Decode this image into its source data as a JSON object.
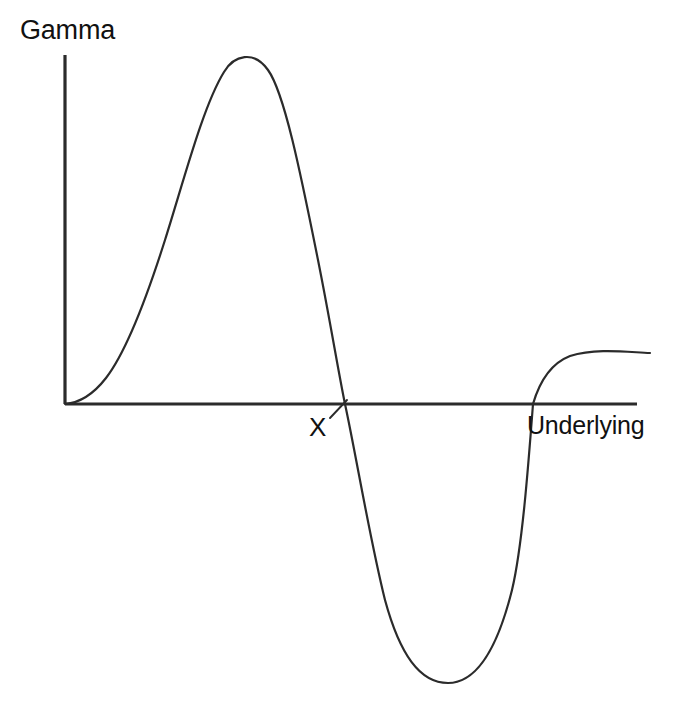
{
  "figure": {
    "width": 675,
    "height": 707,
    "background_color": "#ffffff",
    "line_color": "#2b2b2b",
    "text_color": "#111111"
  },
  "labels": {
    "y_axis": "Gamma",
    "x_axis": "Underlying",
    "strike_marker": "X"
  },
  "chart_data": {
    "type": "line",
    "title": "",
    "subtitle": "",
    "xlabel": "Underlying",
    "ylabel": "Gamma",
    "grid": false,
    "legend": null,
    "axis_style": "open-l-shaped-axes-no-ticks",
    "x_axis_pixel": {
      "x_start": 65,
      "x_end": 637,
      "y": 404
    },
    "y_axis_pixel": {
      "y_start": 55,
      "y_end": 404,
      "x": 65
    },
    "xlim": [
      0,
      1
    ],
    "ylim": [
      -1.0,
      1.0
    ],
    "xticks": [],
    "yticks": [],
    "annotations": [
      {
        "text": "X",
        "meaning": "strike price at zero-gamma crossing",
        "x_pixel": 345,
        "y_pixel": 404,
        "has_tick_mark": true,
        "tick_style": "short-diagonal"
      }
    ],
    "series": [
      {
        "name": "Gamma of a structured position",
        "color": "#2b2b2b",
        "line_width": 2.2,
        "description": "Rises from origin to a positive peak, falls steeply through zero at strike X, reaches a deep negative trough, then rises back through zero and flattens to a positive plateau.",
        "key_points": [
          {
            "label": "origin",
            "x": 0.0,
            "y": 0.0,
            "x_pixel": 65,
            "y_pixel": 404
          },
          {
            "label": "peak",
            "x": 0.31,
            "y": 1.0,
            "x_pixel": 243,
            "y_pixel": 55
          },
          {
            "label": "zero-crossing-up",
            "x": 0.49,
            "y": 0.0,
            "x_pixel": 345,
            "y_pixel": 404
          },
          {
            "label": "trough",
            "x": 0.67,
            "y": -0.8,
            "x_pixel": 448,
            "y_pixel": 683
          },
          {
            "label": "zero-crossing-down",
            "x": 0.82,
            "y": 0.0,
            "x_pixel": 533,
            "y_pixel": 404
          },
          {
            "label": "plateau-right",
            "x": 1.0,
            "y": 0.15,
            "x_pixel": 650,
            "y_pixel": 353
          }
        ],
        "x": [
          0.0,
          0.04,
          0.08,
          0.12,
          0.16,
          0.2,
          0.24,
          0.28,
          0.31,
          0.35,
          0.39,
          0.43,
          0.46,
          0.49,
          0.53,
          0.57,
          0.61,
          0.64,
          0.67,
          0.71,
          0.74,
          0.78,
          0.82,
          0.86,
          0.9,
          0.95,
          1.0
        ],
        "y": [
          0.0,
          0.04,
          0.12,
          0.27,
          0.48,
          0.71,
          0.9,
          0.99,
          1.0,
          0.88,
          0.64,
          0.35,
          0.16,
          0.0,
          -0.28,
          -0.54,
          -0.72,
          -0.79,
          -0.8,
          -0.76,
          -0.62,
          -0.37,
          0.0,
          0.08,
          0.12,
          0.145,
          0.15
        ]
      }
    ],
    "path_pixels": "M 65 404 C 78 403 92 396 106 378 C 126 352 146 300 165 240 C 184 180 203 106 224 72 C 234 55 254 50 268 70 C 284 92 300 170 318 260 C 330 320 338 370 345 404 C 356 455 370 540 385 600 C 400 655 420 683 448 683 C 476 683 497 650 512 590 C 522 548 528 470 533 404 C 540 380 552 363 570 356 C 596 348 626 352 650 353"
  }
}
